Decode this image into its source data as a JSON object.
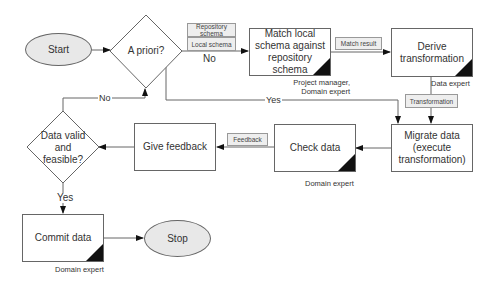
{
  "nodes": {
    "start": {
      "label": "Start",
      "shape": "ellipse"
    },
    "a_priori": {
      "label": "A priori?",
      "shape": "diamond"
    },
    "match": {
      "label": "Match local schema against repository schema",
      "shape": "process",
      "role": "Project manager, Domain expert"
    },
    "derive": {
      "label": "Derive transformation",
      "shape": "process",
      "role": "Data expert"
    },
    "migrate": {
      "label": "Migrate data (execute transformation)",
      "shape": "process"
    },
    "check": {
      "label": "Check data",
      "shape": "process",
      "role": "Domain expert"
    },
    "give_feedback": {
      "label": "Give feedback",
      "shape": "process"
    },
    "valid": {
      "label": "Data valid and feasible?",
      "shape": "diamond"
    },
    "commit": {
      "label": "Commit data",
      "shape": "process",
      "role": "Domain expert"
    },
    "stop": {
      "label": "Stop",
      "shape": "ellipse"
    }
  },
  "artifacts": {
    "repository_schema": "Repository schema",
    "local_schema": "Local schema",
    "match_result": "Match result",
    "transformation": "Transformation",
    "feedback": "Feedback"
  },
  "edges": [
    {
      "from": "start",
      "to": "a_priori",
      "label": ""
    },
    {
      "from": "a_priori",
      "to": "match",
      "label": "No"
    },
    {
      "from": "a_priori",
      "to": "migrate",
      "label": "Yes"
    },
    {
      "from": "match",
      "to": "derive",
      "label": ""
    },
    {
      "from": "derive",
      "to": "migrate",
      "label": ""
    },
    {
      "from": "migrate",
      "to": "check",
      "label": ""
    },
    {
      "from": "check",
      "to": "give_feedback",
      "label": ""
    },
    {
      "from": "give_feedback",
      "to": "valid",
      "label": ""
    },
    {
      "from": "valid",
      "to": "a_priori",
      "label": "No"
    },
    {
      "from": "valid",
      "to": "commit",
      "label": "Yes"
    },
    {
      "from": "commit",
      "to": "stop",
      "label": ""
    }
  ],
  "edge_labels": {
    "a_priori_no": "No",
    "a_priori_yes": "Yes",
    "valid_no": "No",
    "valid_yes": "Yes"
  },
  "colors": {
    "node_fill_ellipse": "#e8e8e8",
    "border": "#666666",
    "corner_marker": "#111111",
    "artifact_fill": "#eeeeee"
  }
}
